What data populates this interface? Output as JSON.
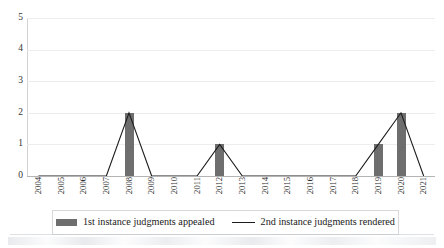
{
  "chart_data": {
    "type": "bar",
    "title": "",
    "subtitle": "",
    "xlabel": "",
    "ylabel": "",
    "ylim": [
      0,
      5
    ],
    "yticks": [
      0,
      1,
      2,
      3,
      4,
      5
    ],
    "grid": true,
    "legend_position": "bottom",
    "categories": [
      "2004",
      "2005",
      "2006",
      "2007",
      "2008",
      "2009",
      "2010",
      "2011",
      "2012",
      "2013",
      "2014",
      "2015",
      "2016",
      "2017",
      "2018",
      "2019",
      "2020",
      "2021"
    ],
    "series": [
      {
        "name": "1st instance judgments appealed",
        "type": "bar",
        "color": "#6e6e6e",
        "values": [
          0,
          0,
          0,
          0,
          2,
          0,
          0,
          0,
          1,
          0,
          0,
          0,
          0,
          0,
          0,
          1,
          2,
          0
        ]
      },
      {
        "name": "2nd instance judgments rendered",
        "type": "line",
        "color": "#1c1c1c",
        "values": [
          0,
          0,
          0,
          0,
          2,
          0,
          0,
          0,
          1,
          0,
          0,
          0,
          0,
          0,
          0,
          1,
          2,
          0
        ]
      }
    ]
  },
  "axes": {
    "y_tick_labels": [
      "5",
      "4",
      "3",
      "2",
      "1",
      "0"
    ],
    "x_tick_labels": [
      "2004",
      "2005",
      "2006",
      "2007",
      "2008",
      "2009",
      "2010",
      "2011",
      "2012",
      "2013",
      "2014",
      "2015",
      "2016",
      "2017",
      "2018",
      "2019",
      "2020",
      "2021"
    ]
  },
  "legend": {
    "items": [
      {
        "label": "1st instance judgments appealed",
        "marker": "bar-swatch-icon",
        "color": "#6e6e6e"
      },
      {
        "label": "2nd instance judgments rendered",
        "marker": "line-sample-icon",
        "color": "#1c1c1c"
      }
    ]
  },
  "colors": {
    "bar": "#6e6e6e",
    "line": "#1c1c1c",
    "gridline": "#ededed",
    "axis": "#b4b4b4",
    "text": "#1a1a1a",
    "background": "#ffffff"
  }
}
